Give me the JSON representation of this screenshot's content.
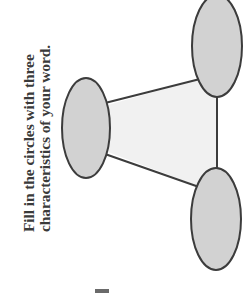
{
  "page": {
    "background_color": "#ffffff",
    "width": 252,
    "height": 298,
    "orientation": "text rotated 90 degrees counter-clockwise"
  },
  "instructions": {
    "full_text": "Fill in the circles with three characteristics of your word.",
    "line_1": "Fill in the circles with three",
    "line_2": "characteristics of your word.",
    "text_color": "#3a3a3a"
  },
  "diagram": {
    "name": "word-web-three-circles",
    "type": "triangle-web",
    "fill_color": "#d2d2d2",
    "stroke_color": "#3c3c3c",
    "center_fill_color": "#f1f1f1",
    "ellipses": [
      {
        "id": "left-circle",
        "label": "",
        "cx": 86,
        "cy": 128,
        "rx": 24,
        "ry": 50
      },
      {
        "id": "top-right-circle",
        "label": "",
        "cx": 217,
        "cy": 46,
        "rx": 25,
        "ry": 51
      },
      {
        "id": "bottom-right-circle",
        "label": "",
        "cx": 216,
        "cy": 219,
        "rx": 25,
        "ry": 51
      }
    ],
    "connectors": [
      {
        "id": "left-to-topright",
        "from": "left-circle",
        "to": "top-right-circle"
      },
      {
        "id": "left-to-bottomright",
        "from": "left-circle",
        "to": "bottom-right-circle"
      },
      {
        "id": "topright-to-bottomright",
        "from": "top-right-circle",
        "to": "bottom-right-circle"
      }
    ]
  },
  "artifact": {
    "name": "scan-artifact",
    "description": "small dark mark near bottom edge"
  }
}
